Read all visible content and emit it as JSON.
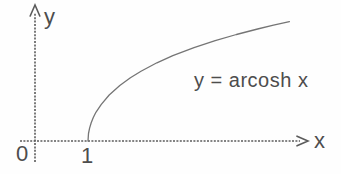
{
  "figure": {
    "colors": {
      "ink": "#4d4d4d",
      "axis": "#5b5b5b",
      "curve": "#757575",
      "background": "#fefefe"
    }
  },
  "chart_data": {
    "type": "line",
    "title": "",
    "annotation": "y = arcosh x",
    "xlabel": "x",
    "ylabel": "y",
    "origin_label": "0",
    "x_ticks": [
      {
        "value": 0,
        "label": "0"
      },
      {
        "value": 1,
        "label": "1"
      }
    ],
    "grid": false,
    "legend": false,
    "domain": [
      1,
      4.8
    ],
    "ylim": [
      0,
      2.6
    ],
    "series": [
      {
        "name": "y = arcosh x",
        "x": [
          1,
          1.01,
          1.03,
          1.06,
          1.1,
          1.15,
          1.25,
          1.4,
          1.6,
          1.8,
          2.0,
          2.3,
          2.6,
          3.0,
          3.4,
          3.8,
          4.2,
          4.5,
          4.8
        ],
        "y": [
          0,
          0.141,
          0.244,
          0.344,
          0.444,
          0.541,
          0.693,
          0.867,
          1.047,
          1.193,
          1.317,
          1.475,
          1.609,
          1.763,
          1.895,
          2.01,
          2.114,
          2.185,
          2.251
        ]
      }
    ]
  }
}
